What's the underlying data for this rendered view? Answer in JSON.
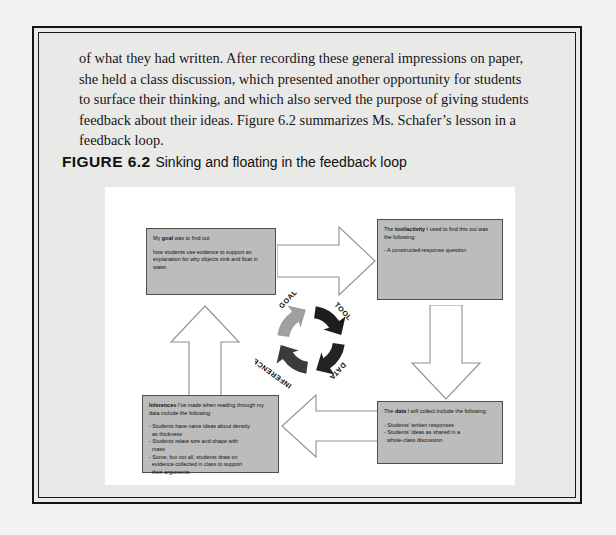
{
  "body_text": "of what they had written. After recording these general impressions on paper, she held a class discussion, which presented another opportunity for students to surface their thinking, and which also served the purpose of giving students feedback about their ideas. Figure 6.2 summarizes Ms. Schafer’s lesson in a feedback loop.",
  "figure": {
    "label": "FIGURE 6.2",
    "title": "Sinking and floating in the feedback loop"
  },
  "boxes": {
    "goal": {
      "heading_pre": "My ",
      "heading_bold": "goal",
      "heading_post": " was to find out",
      "body": "how students use evidence to support an explanation for why objects sink and float in water."
    },
    "tool": {
      "heading_pre": "The ",
      "heading_bold": "tool/activity",
      "heading_post": " I used to find this out was the following:",
      "body": "- A constructed-response question"
    },
    "data": {
      "heading_pre": "The ",
      "heading_bold": "data",
      "heading_post": " I will collect include the following:",
      "body_line1": "- Students’ written responses",
      "body_line2": "- Students’ ideas as shared in a",
      "body_line3": "  whole-class discussion"
    },
    "inference": {
      "heading_bold": "Inferences",
      "heading_post": " I’ve made when reading through my data include the following:",
      "body_line1": "- Students have naive ideas about density",
      "body_line2": "  as thickness",
      "body_line3": "- Students relate size and shape with",
      "body_line4": "  mass",
      "body_line5": "- Some, but not all, students draw on",
      "body_line6": "  evidence collected in class to support",
      "body_line7": "  their arguments"
    }
  },
  "cycle": {
    "labels": {
      "goal": "GOAL",
      "tool": "TOOL",
      "data": "DATA",
      "inference": "INFERENCE"
    },
    "colors": {
      "dark": "#1c1c1c",
      "mid": "#4a4a4a",
      "light": "#9a9a9a",
      "lighter": "#8d8d8d"
    }
  },
  "colors": {
    "page_background": "#e9e9e7",
    "panel_background": "#ffffff",
    "box_fill": "#bcbcbc",
    "box_border": "#4d4d4d",
    "arrow_fill": "#ffffff",
    "arrow_stroke": "#8a8a8a",
    "frame": "#141414"
  }
}
